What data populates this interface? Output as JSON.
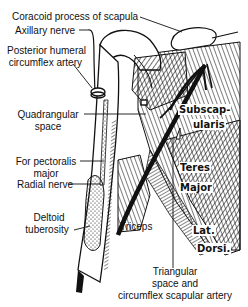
{
  "diagram": {
    "type": "anatomical illustration",
    "labels": {
      "coracoid": "Coracoid process of scapula",
      "axillary": "Axillary nerve",
      "posterior_humeral_1": "Posterior humeral",
      "posterior_humeral_2": "circumflex artery",
      "quadrangular_1": "Quadrangular",
      "quadrangular_2": "space",
      "pectoralis_1": "For pectoralis",
      "pectoralis_2": "major",
      "radial": "Radial nerve",
      "deltoid_1": "Deltoid",
      "deltoid_2": "tuberosity",
      "triceps": "Triceps",
      "triangular_1": "Triangular",
      "triangular_2": "space and",
      "triangular_3": "circumflex scapular artery"
    },
    "muscle_labels": {
      "subscap_1": "Subscap-",
      "subscap_2": "ularis",
      "teres": "Teres",
      "major": "Major",
      "lat": "Lat.",
      "dorsi": "Dorsi."
    },
    "colors": {
      "ink": "#111111",
      "background": "#ffffff"
    }
  }
}
